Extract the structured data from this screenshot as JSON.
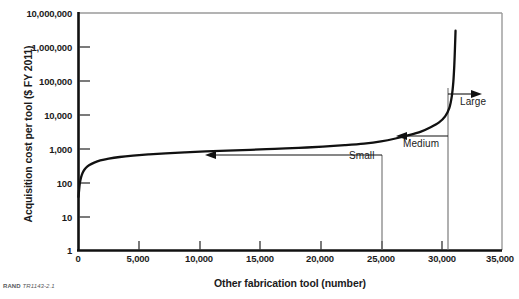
{
  "figure": {
    "source_credit_prefix": "RAND",
    "source_credit_id": "TR1143-2.1"
  },
  "chart_data": {
    "type": "line",
    "title": "",
    "xlabel": "Other fabrication tool (number)",
    "ylabel": "Acquisition cost per tool ($ FY 2011)",
    "xlim": [
      0,
      35000
    ],
    "ylim": [
      1,
      10000000
    ],
    "yscale": "log",
    "xscale": "linear",
    "grid": false,
    "legend": null,
    "xticks": [
      0,
      5000,
      10000,
      15000,
      20000,
      25000,
      30000,
      35000
    ],
    "xticklabels": [
      "0",
      "5,000",
      "10,000",
      "15,000",
      "20,000",
      "25,000",
      "30,000",
      "35,000"
    ],
    "yticks": [
      1,
      10,
      100,
      1000,
      10000,
      100000,
      1000000,
      10000000
    ],
    "yticklabels": [
      "1",
      "10",
      "100",
      "1,000",
      "10,000",
      "100,000",
      "1,000,000",
      "10,000,000"
    ],
    "series": [
      {
        "name": "Acquisition cost per tool",
        "x": [
          0,
          40,
          90,
          160,
          260,
          400,
          600,
          900,
          1300,
          1800,
          2500,
          3400,
          4500,
          5800,
          7200,
          8800,
          10500,
          12300,
          14200,
          16200,
          18200,
          20200,
          22000,
          23600,
          25000,
          26200,
          27300,
          28300,
          29100,
          29800,
          30300,
          30650,
          30850,
          30980,
          31060,
          31120,
          31160
        ],
        "y": [
          38,
          55,
          85,
          120,
          165,
          215,
          270,
          330,
          390,
          450,
          510,
          570,
          625,
          680,
          730,
          780,
          830,
          880,
          930,
          990,
          1060,
          1150,
          1270,
          1420,
          1650,
          2000,
          2500,
          3200,
          4300,
          6000,
          9000,
          16000,
          35000,
          95000,
          300000,
          1100000,
          3000000
        ]
      }
    ],
    "annotations": [
      {
        "name": "small",
        "label": "Small",
        "kind": "range-arrow",
        "direction": "left",
        "x_from": 25000,
        "x_to": 0,
        "y_level": 900
      },
      {
        "name": "medium",
        "label": "Medium",
        "kind": "range-arrow",
        "direction": "left",
        "x_from": 30500,
        "x_to": 25000,
        "y_level": 2400
      },
      {
        "name": "large",
        "label": "Large",
        "kind": "range-arrow",
        "direction": "right",
        "x_from": 30500,
        "x_to": 33000,
        "y_level": 40000
      }
    ],
    "dividers": [
      {
        "name": "small-medium-divider",
        "x": 25000
      },
      {
        "name": "medium-large-divider",
        "x": 30500
      }
    ]
  }
}
